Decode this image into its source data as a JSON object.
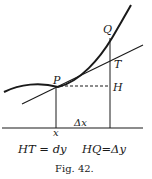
{
  "figure": {
    "caption": "Fig. 42.",
    "labels": {
      "Q": "Q",
      "T": "T",
      "P": "P",
      "H": "H",
      "delta_x": "Δx",
      "x": "x"
    },
    "equations": {
      "left": "HT = dy",
      "right": "HQ=Δy"
    },
    "colors": {
      "ink": "#1a1a1a",
      "background": "#ffffff"
    }
  }
}
